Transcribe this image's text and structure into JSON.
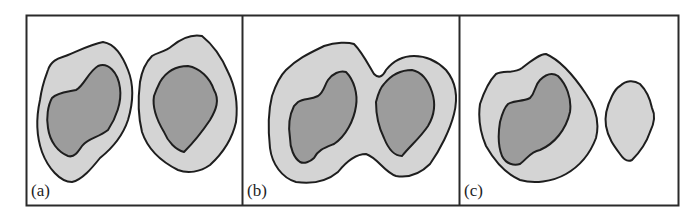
{
  "figure": {
    "panels": [
      {
        "id": "a",
        "label": "(a)",
        "description": "two separate regions, each with an outer light contour and inner dark core"
      },
      {
        "id": "b",
        "label": "(b)",
        "description": "merged outer light contour enclosing two dark cores"
      },
      {
        "id": "c",
        "label": "(c)",
        "description": "one region with dark core and a separate small light region without core"
      }
    ],
    "colors": {
      "outer_fill": "#d4d4d4",
      "inner_fill": "#9c9c9c",
      "stroke": "#1e1e1e",
      "frame": "#2a2a2a",
      "background": "#ffffff"
    }
  }
}
